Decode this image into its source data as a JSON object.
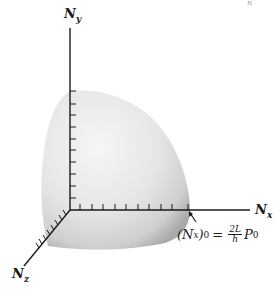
{
  "figure": {
    "type": "3d-surface-octant",
    "axes": {
      "y": {
        "label": "N",
        "sub": "y"
      },
      "x": {
        "label": "N",
        "sub": "x"
      },
      "z": {
        "label": "N",
        "sub": "z"
      }
    },
    "annotation": {
      "lhs_main": "(N",
      "lhs_sub": "x",
      "lhs_close": ")",
      "lhs_outer_sub": "0",
      "equals": "=",
      "frac_num": "2L",
      "frac_den": "h",
      "rhs_main": "P",
      "rhs_sub": "0"
    },
    "corner_mark": "n",
    "colors": {
      "axis": "#1a1a1a",
      "surface_light": "#f2f2f2",
      "surface_dark": "#b8b8b8"
    }
  }
}
